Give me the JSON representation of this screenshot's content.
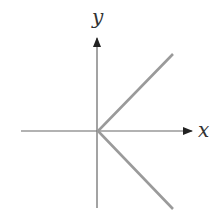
{
  "figure": {
    "type": "graph-of-relation",
    "axes": {
      "x_label": "x",
      "y_label": "y",
      "origin": [
        98,
        131
      ],
      "x_axis": {
        "from": [
          21,
          131
        ],
        "to": [
          192,
          131
        ]
      },
      "y_axis": {
        "from": [
          97,
          208
        ],
        "to": [
          97,
          38
        ]
      }
    },
    "curve": {
      "vertex": [
        98,
        131
      ],
      "upper_end": [
        173,
        54
      ],
      "lower_end": [
        173,
        209
      ],
      "color": "#9a9a9a"
    },
    "axis_color": "#555555"
  }
}
